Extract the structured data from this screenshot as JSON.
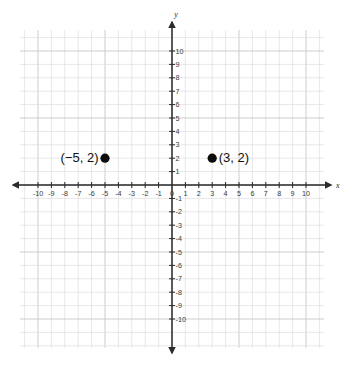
{
  "chart_data": {
    "type": "scatter",
    "title": "",
    "xlabel": "x",
    "ylabel": "y",
    "xlim": [
      -10,
      10
    ],
    "ylim": [
      -10,
      10
    ],
    "grid": true,
    "legend": "none",
    "x_ticks": [
      -10,
      -9,
      -8,
      -7,
      -6,
      -5,
      -4,
      -3,
      -2,
      -1,
      0,
      1,
      2,
      3,
      4,
      5,
      6,
      7,
      8,
      9,
      10
    ],
    "y_ticks": [
      -10,
      -9,
      -8,
      -7,
      -6,
      -5,
      -4,
      -3,
      -2,
      -1,
      1,
      2,
      3,
      4,
      5,
      6,
      7,
      8,
      9,
      10
    ],
    "x_tick_labels": [
      "-10",
      "-9",
      "-8",
      "-7",
      "-6",
      "-5",
      "-4",
      "-3",
      "-2",
      "-1",
      "0",
      "1",
      "2",
      "3",
      "4",
      "5",
      "6",
      "7",
      "8",
      "9",
      "10"
    ],
    "y_tick_labels": [
      "-10",
      "-9",
      "-8",
      "-7",
      "-6",
      "-5",
      "-4",
      "-3",
      "-2",
      "-1",
      "1",
      "2",
      "3",
      "4",
      "5",
      "6",
      "7",
      "8",
      "9",
      "10"
    ],
    "origin_label": "0",
    "points": [
      {
        "name": "point-a",
        "x": -5,
        "y": 2,
        "label": "(−5, 2)",
        "label_side": "left"
      },
      {
        "name": "point-b",
        "x": 3,
        "y": 2,
        "label": "(3, 2)",
        "label_side": "right"
      }
    ],
    "colors": {
      "point": "#0d0d0d",
      "axis": "#2b2b2b",
      "grid_minor": "#dedede",
      "grid_major": "#c7c7c7",
      "tick_text": "#3a3a3a",
      "background": "#ffffff"
    }
  }
}
